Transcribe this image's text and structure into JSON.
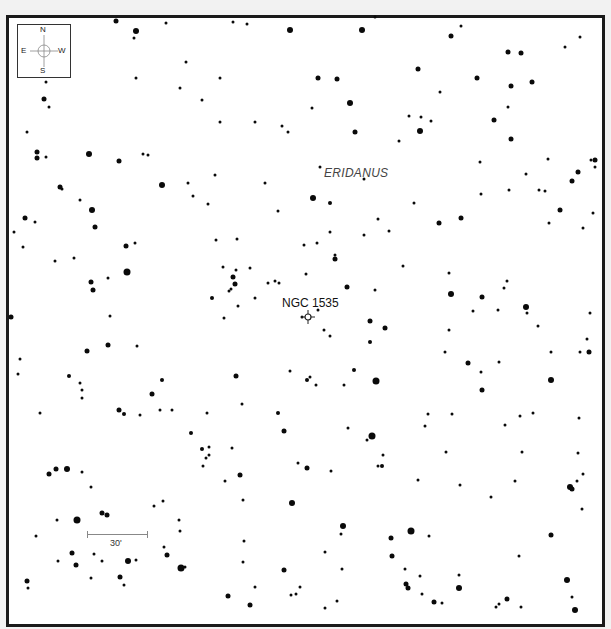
{
  "chart_data": {
    "type": "scatter",
    "title": "",
    "constellation_label": "ERIDANUS",
    "target": {
      "name": "NGC 1535",
      "x": 308,
      "y": 317
    },
    "compass": {
      "north": "N",
      "south": "S",
      "east": "E",
      "west": "W"
    },
    "scale": {
      "label": "30'",
      "x1": 87,
      "x2": 148,
      "y": 534
    },
    "grid": false,
    "legend": "none",
    "stars": [
      [
        116,
        21,
        2.5
      ],
      [
        136,
        31,
        3
      ],
      [
        134,
        38,
        1.5
      ],
      [
        166,
        23,
        1.5
      ],
      [
        233,
        22,
        1.5
      ],
      [
        247,
        24,
        1.5
      ],
      [
        290,
        30,
        3
      ],
      [
        362,
        30,
        3
      ],
      [
        375,
        17,
        1.5
      ],
      [
        451,
        36,
        2.5
      ],
      [
        461,
        26,
        1.5
      ],
      [
        508,
        52,
        2.5
      ],
      [
        521,
        53,
        2.5
      ],
      [
        565,
        47,
        1.5
      ],
      [
        580,
        37,
        1.5
      ],
      [
        46,
        82,
        1.5
      ],
      [
        44,
        99,
        2.5
      ],
      [
        49,
        107,
        1.5
      ],
      [
        27,
        132,
        1.5
      ],
      [
        37,
        152,
        2.5
      ],
      [
        46,
        157,
        1.5
      ],
      [
        89,
        154,
        3
      ],
      [
        119,
        161,
        2.5
      ],
      [
        143,
        154,
        1.5
      ],
      [
        148,
        155,
        1.5
      ],
      [
        136,
        78,
        1.5
      ],
      [
        186,
        62,
        1.5
      ],
      [
        180,
        88,
        1.5
      ],
      [
        202,
        100,
        1.5
      ],
      [
        220,
        78,
        1.5
      ],
      [
        220,
        122,
        1.5
      ],
      [
        255,
        122,
        1.5
      ],
      [
        188,
        183,
        1.5
      ],
      [
        193,
        196,
        1.5
      ],
      [
        208,
        204,
        1.5
      ],
      [
        162,
        185,
        3
      ],
      [
        318,
        78,
        2.5
      ],
      [
        350,
        103,
        3
      ],
      [
        337,
        79,
        2.5
      ],
      [
        312,
        108,
        1.5
      ],
      [
        282,
        126,
        1.5
      ],
      [
        288,
        132,
        1.5
      ],
      [
        418,
        69,
        2.5
      ],
      [
        440,
        92,
        1.5
      ],
      [
        477,
        78,
        2.5
      ],
      [
        494,
        120,
        2.5
      ],
      [
        511,
        86,
        2.5
      ],
      [
        508,
        107,
        1.5
      ],
      [
        355,
        132,
        2.5
      ],
      [
        399,
        141,
        1.5
      ],
      [
        420,
        131,
        3
      ],
      [
        409,
        116,
        1.5
      ],
      [
        421,
        117,
        1.5
      ],
      [
        431,
        121,
        1.5
      ],
      [
        511,
        139,
        2.5
      ],
      [
        548,
        159,
        1.5
      ],
      [
        591,
        160,
        1.5
      ],
      [
        532,
        82,
        2.5
      ],
      [
        60,
        187,
        2.5
      ],
      [
        62,
        189,
        1.5
      ],
      [
        37,
        158,
        2.5
      ],
      [
        80,
        200,
        1.5
      ],
      [
        92,
        210,
        3
      ],
      [
        95,
        227,
        2.5
      ],
      [
        25,
        218,
        2.5
      ],
      [
        35,
        222,
        1.5
      ],
      [
        14,
        232,
        1.5
      ],
      [
        23,
        247,
        1.5
      ],
      [
        126,
        246,
        2.5
      ],
      [
        135,
        243,
        1.5
      ],
      [
        127,
        272,
        3.5
      ],
      [
        91,
        282,
        2.5
      ],
      [
        108,
        278,
        1.5
      ],
      [
        55,
        261,
        1.5
      ],
      [
        74,
        258,
        1.5
      ],
      [
        93,
        290,
        2.5
      ],
      [
        215,
        175,
        1.5
      ],
      [
        265,
        183,
        1.5
      ],
      [
        278,
        211,
        1.5
      ],
      [
        320,
        167,
        1.5
      ],
      [
        313,
        198,
        3
      ],
      [
        330,
        203,
        2
      ],
      [
        216,
        240,
        1.5
      ],
      [
        237,
        239,
        1.5
      ],
      [
        223,
        267,
        1.5
      ],
      [
        236,
        270,
        1.5
      ],
      [
        250,
        268,
        1.5
      ],
      [
        233,
        277,
        2.5
      ],
      [
        235,
        284,
        2.5
      ],
      [
        229,
        291,
        1.5
      ],
      [
        231,
        289,
        1.5
      ],
      [
        255,
        298,
        1.5
      ],
      [
        212,
        298,
        2
      ],
      [
        238,
        306,
        1.5
      ],
      [
        364,
        179,
        1.5
      ],
      [
        414,
        203,
        1.5
      ],
      [
        439,
        223,
        2.5
      ],
      [
        461,
        218,
        2.5
      ],
      [
        480,
        162,
        1.5
      ],
      [
        481,
        194,
        1.5
      ],
      [
        509,
        190,
        1.5
      ],
      [
        526,
        174,
        1.5
      ],
      [
        539,
        190,
        1.5
      ],
      [
        545,
        191,
        1.5
      ],
      [
        560,
        210,
        2.5
      ],
      [
        572,
        181,
        2.5
      ],
      [
        578,
        172,
        2.5
      ],
      [
        595,
        160,
        2.5
      ],
      [
        593,
        213,
        1.5
      ],
      [
        378,
        219,
        1.5
      ],
      [
        389,
        231,
        1.5
      ],
      [
        317,
        243,
        1.5
      ],
      [
        330,
        232,
        1.5
      ],
      [
        304,
        245,
        1.5
      ],
      [
        335,
        259,
        2.5
      ],
      [
        364,
        235,
        1.5
      ],
      [
        403,
        266,
        1.5
      ],
      [
        449,
        273,
        1.5
      ],
      [
        583,
        228,
        1.5
      ],
      [
        275,
        281,
        1.5
      ],
      [
        268,
        283,
        1.5
      ],
      [
        279,
        283,
        1.5
      ],
      [
        306,
        274,
        1.5
      ],
      [
        318,
        310,
        1.5
      ],
      [
        335,
        255,
        1.5
      ],
      [
        347,
        287,
        2.5
      ],
      [
        375,
        290,
        1.5
      ],
      [
        451,
        294,
        3
      ],
      [
        482,
        297,
        2.5
      ],
      [
        504,
        288,
        1.5
      ],
      [
        526,
        307,
        3
      ],
      [
        507,
        281,
        1.5
      ],
      [
        549,
        223,
        1.5
      ],
      [
        595,
        167,
        1.5
      ],
      [
        11,
        317,
        2.5
      ],
      [
        18,
        374,
        1.5
      ],
      [
        20,
        359,
        1.5
      ],
      [
        69,
        376,
        2
      ],
      [
        80,
        383,
        1.5
      ],
      [
        82,
        390,
        1.5
      ],
      [
        82,
        398,
        1.5
      ],
      [
        87,
        351,
        2.5
      ],
      [
        108,
        345,
        2.5
      ],
      [
        110,
        316,
        1.5
      ],
      [
        137,
        346,
        1.5
      ],
      [
        152,
        394,
        2.5
      ],
      [
        162,
        380,
        2
      ],
      [
        160,
        410,
        1.5
      ],
      [
        119,
        410,
        2.5
      ],
      [
        124,
        414,
        2
      ],
      [
        140,
        415,
        1.5
      ],
      [
        172,
        410,
        1.5
      ],
      [
        207,
        413,
        1.5
      ],
      [
        236,
        376,
        2.5
      ],
      [
        242,
        404,
        1.5
      ],
      [
        191,
        433,
        2
      ],
      [
        202,
        449,
        2
      ],
      [
        209,
        447,
        1.5
      ],
      [
        209,
        455,
        1.5
      ],
      [
        206,
        458,
        1.5
      ],
      [
        232,
        448,
        1.5
      ],
      [
        278,
        413,
        2
      ],
      [
        284,
        431,
        2.5
      ],
      [
        290,
        371,
        1.5
      ],
      [
        302,
        317,
        1.5
      ],
      [
        224,
        318,
        1.5
      ],
      [
        40,
        413,
        1.5
      ],
      [
        370,
        321,
        2.5
      ],
      [
        385,
        328,
        2.5
      ],
      [
        370,
        342,
        2
      ],
      [
        324,
        330,
        1.5
      ],
      [
        330,
        336,
        1.5
      ],
      [
        354,
        370,
        2
      ],
      [
        376,
        381,
        3.5
      ],
      [
        307,
        380,
        2
      ],
      [
        310,
        377,
        1.5
      ],
      [
        316,
        385,
        1.5
      ],
      [
        344,
        385,
        1.5
      ],
      [
        449,
        330,
        1.5
      ],
      [
        445,
        352,
        1.5
      ],
      [
        468,
        363,
        2.5
      ],
      [
        481,
        372,
        1.5
      ],
      [
        482,
        390,
        2.5
      ],
      [
        499,
        362,
        1.5
      ],
      [
        538,
        326,
        1.5
      ],
      [
        551,
        352,
        1.5
      ],
      [
        580,
        352,
        1.5
      ],
      [
        589,
        352,
        2.5
      ],
      [
        551,
        380,
        3
      ],
      [
        452,
        414,
        1.5
      ],
      [
        348,
        428,
        1.5
      ],
      [
        372,
        436,
        3.5
      ],
      [
        367,
        440,
        1.5
      ],
      [
        425,
        426,
        1.5
      ],
      [
        428,
        414,
        1.5
      ],
      [
        520,
        416,
        1.5
      ],
      [
        533,
        413,
        1.5
      ],
      [
        578,
        453,
        1.5
      ],
      [
        383,
        455,
        1.5
      ],
      [
        382,
        466,
        2
      ],
      [
        446,
        452,
        1.5
      ],
      [
        579,
        418,
        1.5
      ],
      [
        473,
        311,
        1.5
      ],
      [
        498,
        310,
        1.5
      ],
      [
        527,
        313,
        1.5
      ],
      [
        590,
        313,
        1.5
      ],
      [
        587,
        339,
        1.5
      ],
      [
        505,
        425,
        1.5
      ],
      [
        49,
        474,
        2.5
      ],
      [
        56,
        469,
        2.5
      ],
      [
        67,
        469,
        3
      ],
      [
        82,
        472,
        1.5
      ],
      [
        91,
        487,
        1.5
      ],
      [
        57,
        520,
        1.5
      ],
      [
        77,
        520,
        3.5
      ],
      [
        102,
        513,
        2.5
      ],
      [
        107,
        515,
        2.5
      ],
      [
        36,
        536,
        1.5
      ],
      [
        72,
        553,
        2.5
      ],
      [
        58,
        561,
        1.5
      ],
      [
        76,
        565,
        2.5
      ],
      [
        91,
        578,
        1.5
      ],
      [
        94,
        554,
        1.5
      ],
      [
        102,
        561,
        1.5
      ],
      [
        120,
        577,
        2.5
      ],
      [
        124,
        585,
        1.5
      ],
      [
        128,
        561,
        3
      ],
      [
        136,
        560,
        1.5
      ],
      [
        154,
        506,
        1.5
      ],
      [
        163,
        501,
        1.5
      ],
      [
        179,
        520,
        1.5
      ],
      [
        180,
        531,
        1.5
      ],
      [
        164,
        547,
        1.5
      ],
      [
        167,
        555,
        2.5
      ],
      [
        185,
        567,
        1.5
      ],
      [
        181,
        568,
        3.5
      ],
      [
        27,
        581,
        2.5
      ],
      [
        28,
        588,
        1.5
      ],
      [
        228,
        596,
        2.5
      ],
      [
        250,
        605,
        2.5
      ],
      [
        240,
        475,
        2.5
      ],
      [
        243,
        500,
        1.5
      ],
      [
        244,
        541,
        1.5
      ],
      [
        243,
        562,
        1.5
      ],
      [
        203,
        466,
        1.5
      ],
      [
        225,
        481,
        1.5
      ],
      [
        292,
        503,
        3
      ],
      [
        284,
        570,
        2.5
      ],
      [
        298,
        463,
        1.5
      ],
      [
        255,
        587,
        1.5
      ],
      [
        291,
        595,
        1.5
      ],
      [
        296,
        594,
        1.5
      ],
      [
        300,
        587,
        1.5
      ],
      [
        307,
        468,
        2.5
      ],
      [
        331,
        471,
        1.5
      ],
      [
        378,
        466,
        1.5
      ],
      [
        418,
        480,
        1.5
      ],
      [
        460,
        485,
        1.5
      ],
      [
        491,
        497,
        1.5
      ],
      [
        515,
        481,
        1.5
      ],
      [
        522,
        452,
        1.5
      ],
      [
        570,
        487,
        3
      ],
      [
        572,
        489,
        2.5
      ],
      [
        577,
        481,
        1.5
      ],
      [
        583,
        474,
        1.5
      ],
      [
        582,
        509,
        1.5
      ],
      [
        551,
        535,
        2.5
      ],
      [
        519,
        556,
        1.5
      ],
      [
        343,
        526,
        3
      ],
      [
        341,
        534,
        1.5
      ],
      [
        391,
        538,
        2.5
      ],
      [
        411,
        531,
        3.5
      ],
      [
        325,
        552,
        1.5
      ],
      [
        392,
        556,
        2.5
      ],
      [
        429,
        536,
        1.5
      ],
      [
        342,
        569,
        1.5
      ],
      [
        406,
        584,
        2.5
      ],
      [
        408,
        588,
        2.5
      ],
      [
        422,
        594,
        1.5
      ],
      [
        434,
        602,
        2.5
      ],
      [
        442,
        603,
        1.5
      ],
      [
        459,
        588,
        3
      ],
      [
        420,
        576,
        1.5
      ],
      [
        496,
        607,
        1.5
      ],
      [
        499,
        604,
        1.5
      ],
      [
        507,
        599,
        2.5
      ],
      [
        521,
        607,
        1.5
      ],
      [
        567,
        580,
        3
      ],
      [
        572,
        597,
        1.5
      ],
      [
        575,
        610,
        3
      ],
      [
        325,
        608,
        1.5
      ],
      [
        337,
        601,
        1.5
      ],
      [
        405,
        569,
        1.5
      ],
      [
        459,
        575,
        1.5
      ]
    ]
  }
}
